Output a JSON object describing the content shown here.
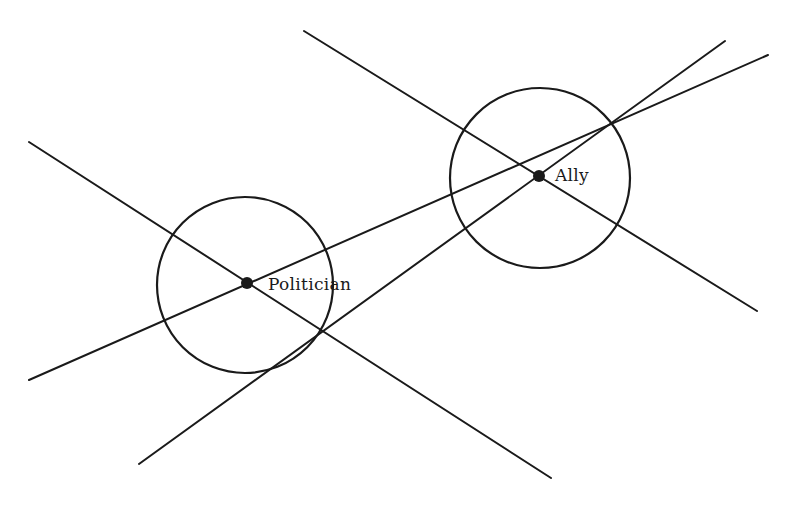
{
  "diagram": {
    "stroke_color": "#1a1a1a",
    "background": "#ffffff",
    "nodes": [
      {
        "id": "politician",
        "label": "Politician",
        "x": 247,
        "y": 283,
        "circle": {
          "cx": 245,
          "cy": 285,
          "r": 88
        },
        "label_x": 268,
        "label_y": 274
      },
      {
        "id": "ally",
        "label": "Ally",
        "x": 539,
        "y": 176,
        "circle": {
          "cx": 540,
          "cy": 178,
          "r": 90
        },
        "label_x": 555,
        "label_y": 165
      }
    ],
    "lines": [
      {
        "id": "politician-line-1",
        "x1": 29,
        "y1": 142,
        "x2": 551,
        "y2": 478
      },
      {
        "id": "politician-line-2",
        "x1": 29,
        "y1": 380,
        "x2": 768,
        "y2": 55
      },
      {
        "id": "ally-line-1",
        "x1": 304,
        "y1": 31,
        "x2": 757,
        "y2": 311
      },
      {
        "id": "ally-line-2",
        "x1": 139,
        "y1": 464,
        "x2": 725,
        "y2": 41
      }
    ]
  }
}
